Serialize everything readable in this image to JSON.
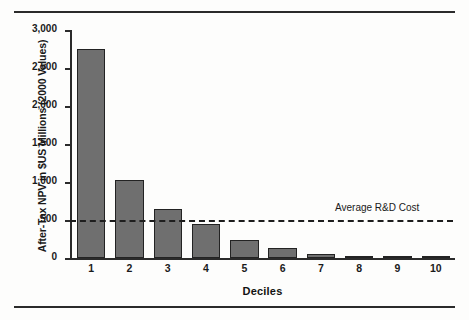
{
  "chart_data": {
    "type": "bar",
    "title": "",
    "xlabel": "Deciles",
    "ylabel": "After-Tax NPV in $US Millions (2000 Values)",
    "categories": [
      "1",
      "2",
      "3",
      "4",
      "5",
      "6",
      "7",
      "8",
      "9",
      "10"
    ],
    "values": [
      2750,
      1030,
      640,
      450,
      240,
      130,
      55,
      25,
      8,
      2
    ],
    "ylim": [
      0,
      3000
    ],
    "yticks": [
      0,
      500,
      1000,
      1500,
      2000,
      2500,
      3000
    ],
    "ytick_labels": [
      "0",
      "500",
      "1,000",
      "1,500",
      "2,000",
      "2,500",
      "3,000"
    ],
    "grid": false,
    "legend": null,
    "bar_color": "#6f6f6f",
    "bar_edge_color": "#232323",
    "annotations": [
      {
        "name": "average-rd-cost-line",
        "label": "Average R&D Cost",
        "value": 500,
        "style": "dashed",
        "color": "#1d1d1d"
      }
    ]
  },
  "figure": {
    "rule_color": "#2b2b2b",
    "background": "#fdfdfc"
  }
}
